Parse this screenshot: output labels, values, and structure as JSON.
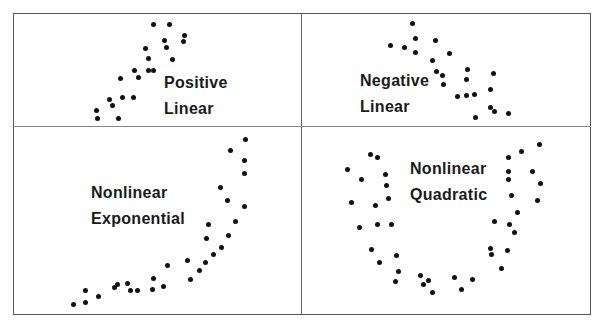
{
  "chart_data": [
    {
      "type": "scatter",
      "panel": "top-left",
      "title_lines": [
        "Positive",
        "Linear"
      ],
      "label_pos": [
        164,
        70
      ],
      "points": [
        [
          153,
          24
        ],
        [
          169,
          24
        ],
        [
          184,
          35
        ],
        [
          183,
          41
        ],
        [
          164,
          40
        ],
        [
          166,
          47
        ],
        [
          145,
          48
        ],
        [
          148,
          58
        ],
        [
          172,
          59
        ],
        [
          148,
          70
        ],
        [
          153,
          70
        ],
        [
          134,
          70
        ],
        [
          138,
          77
        ],
        [
          120,
          78
        ],
        [
          122,
          97
        ],
        [
          133,
          97
        ],
        [
          109,
          99
        ],
        [
          112,
          105
        ],
        [
          96,
          110
        ],
        [
          97,
          118
        ],
        [
          118,
          118
        ]
      ]
    },
    {
      "type": "scatter",
      "panel": "top-right",
      "title_lines": [
        "Negative",
        "Linear"
      ],
      "label_pos": [
        360,
        68
      ],
      "points": [
        [
          412,
          23
        ],
        [
          415,
          38
        ],
        [
          435,
          40
        ],
        [
          390,
          45
        ],
        [
          404,
          47
        ],
        [
          415,
          52
        ],
        [
          449,
          53
        ],
        [
          432,
          60
        ],
        [
          436,
          71
        ],
        [
          442,
          75
        ],
        [
          467,
          69
        ],
        [
          493,
          73
        ],
        [
          466,
          79
        ],
        [
          443,
          84
        ],
        [
          490,
          89
        ],
        [
          457,
          96
        ],
        [
          466,
          95
        ],
        [
          474,
          94
        ],
        [
          490,
          107
        ],
        [
          494,
          111
        ],
        [
          508,
          113
        ],
        [
          475,
          117
        ]
      ]
    },
    {
      "type": "scatter",
      "panel": "bottom-left",
      "title_lines": [
        "Nonlinear",
        "Exponential"
      ],
      "label_pos": [
        91,
        180
      ],
      "points": [
        [
          245,
          139
        ],
        [
          230,
          150
        ],
        [
          244,
          160
        ],
        [
          244,
          173
        ],
        [
          220,
          187
        ],
        [
          227,
          200
        ],
        [
          244,
          206
        ],
        [
          208,
          224
        ],
        [
          235,
          221
        ],
        [
          206,
          238
        ],
        [
          228,
          235
        ],
        [
          221,
          247
        ],
        [
          213,
          254
        ],
        [
          205,
          262
        ],
        [
          187,
          260
        ],
        [
          199,
          270
        ],
        [
          167,
          265
        ],
        [
          190,
          279
        ],
        [
          153,
          278
        ],
        [
          163,
          286
        ],
        [
          152,
          289
        ],
        [
          117,
          284
        ],
        [
          114,
          287
        ],
        [
          127,
          283
        ],
        [
          130,
          290
        ],
        [
          137,
          290
        ],
        [
          85,
          290
        ],
        [
          98,
          296
        ],
        [
          85,
          302
        ],
        [
          73,
          304
        ]
      ]
    },
    {
      "type": "scatter",
      "panel": "bottom-right",
      "title_lines": [
        "Nonlinear",
        "Quadratic"
      ],
      "label_pos": [
        410,
        156
      ],
      "points": [
        [
          539,
          144
        ],
        [
          521,
          151
        ],
        [
          508,
          157
        ],
        [
          532,
          171
        ],
        [
          508,
          171
        ],
        [
          508,
          179
        ],
        [
          540,
          183
        ],
        [
          511,
          195
        ],
        [
          537,
          200
        ],
        [
          517,
          212
        ],
        [
          494,
          221
        ],
        [
          509,
          224
        ],
        [
          514,
          232
        ],
        [
          490,
          248
        ],
        [
          491,
          254
        ],
        [
          507,
          250
        ],
        [
          501,
          268
        ],
        [
          472,
          279
        ],
        [
          454,
          277
        ],
        [
          461,
          289
        ],
        [
          370,
          154
        ],
        [
          377,
          157
        ],
        [
          347,
          169
        ],
        [
          385,
          174
        ],
        [
          361,
          179
        ],
        [
          386,
          185
        ],
        [
          388,
          198
        ],
        [
          351,
          202
        ],
        [
          375,
          205
        ],
        [
          377,
          224
        ],
        [
          391,
          224
        ],
        [
          359,
          227
        ],
        [
          371,
          249
        ],
        [
          396,
          255
        ],
        [
          379,
          262
        ],
        [
          398,
          271
        ],
        [
          395,
          281
        ],
        [
          420,
          275
        ],
        [
          428,
          280
        ],
        [
          423,
          284
        ],
        [
          432,
          292
        ]
      ]
    }
  ],
  "layout": {
    "frame": {
      "left": 13,
      "top": 13,
      "width": 578,
      "height": 302
    },
    "vdivider_x": 301,
    "hdivider_y": 126
  }
}
